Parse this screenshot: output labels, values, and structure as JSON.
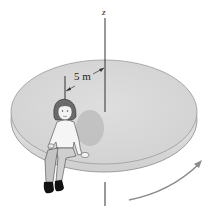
{
  "figure": {
    "axis_label": "z",
    "dimension_label": "5 m",
    "colors": {
      "platform_top": "#d9d9d9",
      "platform_rim": "#e8e8e8",
      "platform_edge": "#8a8a8a",
      "axis": "#333333",
      "rotation_arrow": "#8c8c8c",
      "shadow": "#bdbdbd"
    }
  }
}
